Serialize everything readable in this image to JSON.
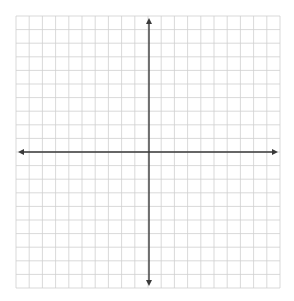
{
  "diagram": {
    "type": "coordinate-plane",
    "grid": {
      "left": 16,
      "top": 16,
      "right": 280,
      "bottom": 288,
      "columns": 20,
      "rows": 20,
      "line_color": "#cfcfcf",
      "line_width": 0.8
    },
    "axes": {
      "color": "#3a3a3a",
      "width": 1.4,
      "origin_column": 10,
      "origin_row": 10,
      "x_axis_arrows": [
        "left",
        "right"
      ],
      "y_axis_arrows": [
        "up",
        "down"
      ]
    },
    "labels": []
  }
}
